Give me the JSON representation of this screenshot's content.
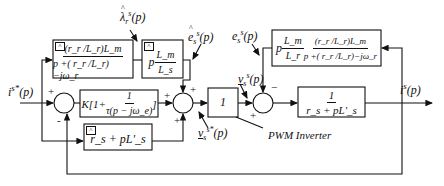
{
  "diagram": {
    "type": "block-diagram",
    "signals": {
      "input": "i",
      "input_sup": "s*",
      "input_arg": "(p)",
      "output": "i",
      "output_sup": "s",
      "output_arg": "(p)",
      "lambda_hat": "λ",
      "lambda_sub": "r",
      "lambda_sup": "s",
      "lambda_arg": "(p)",
      "e_hat": "e",
      "e_hat_sub": "s",
      "e_hat_sup": "s",
      "e_hat_arg": "(p)",
      "e": "e",
      "e_sub": "s",
      "e_sup": "s",
      "e_arg": "(p)",
      "v": "v",
      "v_sub": "s",
      "v_sup": "s",
      "v_arg": "(p)",
      "v_ref": "v",
      "v_ref_sub": "s",
      "v_ref_sup": "s*",
      "v_ref_arg": "(p)"
    },
    "blocks": {
      "flux_estimator": {
        "num": "(r_r /L_r)L_m",
        "den": "p +( r_r /L_r)−jω_r",
        "hat": "^"
      },
      "emf_estimator": {
        "prefix": "p",
        "num": "L_m",
        "den": "L_s",
        "hat": "^"
      },
      "pi_controller": {
        "text": "K[1+",
        "num": "1",
        "den": "τ(p − jω_e)",
        "close": "]"
      },
      "impedance_estimator": {
        "text": "r_s + pL'_s",
        "hat": "^"
      },
      "pwm_inverter": {
        "text": "1"
      },
      "machine_emf": {
        "prefix": "p",
        "num1": "L_m",
        "den1": "L_r",
        "num2": "(r_r /L_r)L_m",
        "den2": "p +( r_r /L_r)−jω_r"
      },
      "stator_plant": {
        "num": "1",
        "den": "r_s + pL'_s"
      }
    },
    "signs": {
      "sum1_plus": "+",
      "sum1_minus": "-",
      "sum2_left": "+",
      "sum2_top": "+",
      "sum2_bottom": "+",
      "sum3_top": "−",
      "sum3_left": "+"
    },
    "annotations": {
      "pwm_label": "PWM Inverter"
    }
  }
}
